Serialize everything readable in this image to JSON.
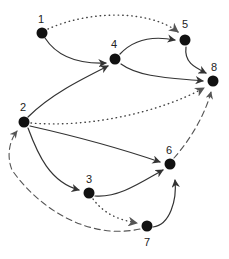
{
  "diagram": {
    "type": "directed-graph",
    "colors": {
      "node": "#111111",
      "edge": "#333333",
      "dashed_edge": "#555555",
      "dotted_edge": "#444444"
    },
    "nodes": [
      {
        "id": "1",
        "label": "1",
        "x": 42,
        "y": 33,
        "lx": 41,
        "ly": 23
      },
      {
        "id": "2",
        "label": "2",
        "x": 24,
        "y": 122,
        "lx": 23,
        "ly": 111
      },
      {
        "id": "3",
        "label": "3",
        "x": 89,
        "y": 193,
        "lx": 89,
        "ly": 183
      },
      {
        "id": "4",
        "label": "4",
        "x": 115,
        "y": 59,
        "lx": 114,
        "ly": 48
      },
      {
        "id": "5",
        "label": "5",
        "x": 185,
        "y": 40,
        "lx": 185,
        "ly": 28
      },
      {
        "id": "6",
        "label": "6",
        "x": 170,
        "y": 164,
        "lx": 169,
        "ly": 154
      },
      {
        "id": "7",
        "label": "7",
        "x": 147,
        "y": 226,
        "lx": 147,
        "ly": 246
      },
      {
        "id": "8",
        "label": "8",
        "x": 213,
        "y": 81,
        "lx": 214,
        "ly": 71
      }
    ],
    "edges": [
      {
        "from": "1",
        "to": "4",
        "style": "solid"
      },
      {
        "from": "2",
        "to": "4",
        "style": "solid"
      },
      {
        "from": "4",
        "to": "5",
        "style": "solid"
      },
      {
        "from": "4",
        "to": "8",
        "style": "solid"
      },
      {
        "from": "5",
        "to": "8",
        "style": "solid"
      },
      {
        "from": "2",
        "to": "6",
        "style": "solid"
      },
      {
        "from": "2",
        "to": "3",
        "style": "solid"
      },
      {
        "from": "3",
        "to": "6",
        "style": "solid"
      },
      {
        "from": "7",
        "to": "6",
        "style": "solid"
      },
      {
        "from": "1",
        "to": "5",
        "style": "dotted"
      },
      {
        "from": "2",
        "to": "8",
        "style": "dotted"
      },
      {
        "from": "3",
        "to": "7",
        "style": "dotted"
      },
      {
        "from": "6",
        "to": "8",
        "style": "dashed"
      },
      {
        "from": "7",
        "to": "2",
        "style": "dashed"
      }
    ]
  }
}
